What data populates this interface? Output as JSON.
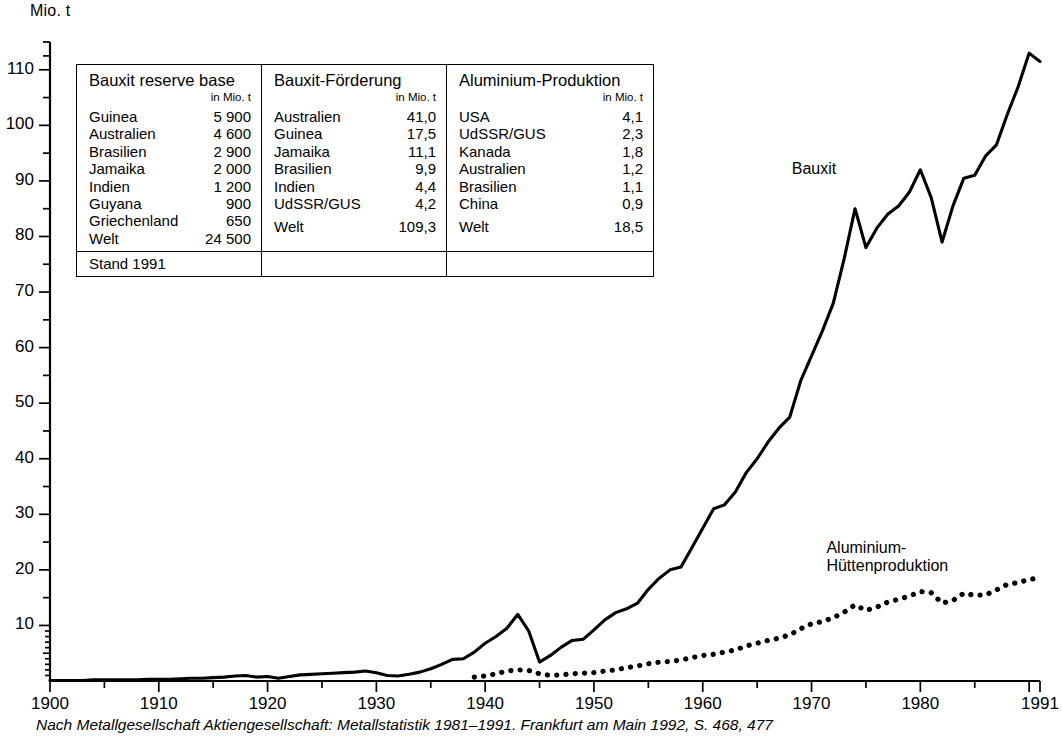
{
  "axis": {
    "y_unit": "Mio. t",
    "y_ticks": [
      "10",
      "20",
      "30",
      "40",
      "50",
      "60",
      "70",
      "80",
      "90",
      "100",
      "110"
    ],
    "x_ticks": [
      "1900",
      "1910",
      "1920",
      "1930",
      "1940",
      "1950",
      "1960",
      "1970",
      "1980",
      "1991"
    ]
  },
  "series_labels": {
    "bauxit": "Bauxit",
    "aluminium": "Aluminium-\nHüttenproduktion"
  },
  "caption": "Nach Metallgesellschaft Aktiengesellschaft: Metallstatistik 1981–1991. Frankfurt am Main 1992, S. 468, 477",
  "table": {
    "columns": [
      {
        "header": "Bauxit reserve base",
        "unit": "in Mio. t",
        "rows": [
          {
            "label": "Guinea",
            "value": "5 900"
          },
          {
            "label": "Australien",
            "value": "4 600"
          },
          {
            "label": "Brasilien",
            "value": "2 900"
          },
          {
            "label": "Jamaika",
            "value": "2 000"
          },
          {
            "label": "Indien",
            "value": "1 200"
          },
          {
            "label": "Guyana",
            "value": "900"
          },
          {
            "label": "Griechenland",
            "value": "650"
          }
        ],
        "total": {
          "label": "Welt",
          "value": "24 500"
        },
        "footer": "Stand 1991"
      },
      {
        "header": "Bauxit-Förderung",
        "unit": "in Mio. t",
        "rows": [
          {
            "label": "Australien",
            "value": "41,0"
          },
          {
            "label": "Guinea",
            "value": "17,5"
          },
          {
            "label": "Jamaika",
            "value": "11,1"
          },
          {
            "label": "Brasilien",
            "value": "9,9"
          },
          {
            "label": "Indien",
            "value": "4,4"
          },
          {
            "label": "UdSSR/GUS",
            "value": "4,2"
          }
        ],
        "total": {
          "label": "Welt",
          "value": "109,3"
        },
        "footer": ""
      },
      {
        "header": "Aluminium-Produktion",
        "unit": "in Mio. t",
        "rows": [
          {
            "label": "USA",
            "value": "4,1"
          },
          {
            "label": "UdSSR/GUS",
            "value": "2,3"
          },
          {
            "label": "Kanada",
            "value": "1,8"
          },
          {
            "label": "Australien",
            "value": "1,2"
          },
          {
            "label": "Brasilien",
            "value": "1,1"
          },
          {
            "label": "China",
            "value": "0,9"
          }
        ],
        "total": {
          "label": "Welt",
          "value": "18,5"
        },
        "footer": ""
      }
    ]
  },
  "chart_data": {
    "type": "line",
    "title": "",
    "xlabel": "",
    "ylabel": "Mio. t",
    "xlim": [
      1900,
      1991
    ],
    "ylim": [
      0,
      115
    ],
    "grid": false,
    "legend": "inline-annotations",
    "series": [
      {
        "name": "Bauxit",
        "style": "solid",
        "color": "#000000",
        "x": [
          1900,
          1901,
          1902,
          1903,
          1904,
          1905,
          1906,
          1907,
          1908,
          1909,
          1910,
          1911,
          1912,
          1913,
          1914,
          1915,
          1916,
          1917,
          1918,
          1919,
          1920,
          1921,
          1922,
          1923,
          1924,
          1925,
          1926,
          1927,
          1928,
          1929,
          1930,
          1931,
          1932,
          1933,
          1934,
          1935,
          1936,
          1937,
          1938,
          1939,
          1940,
          1941,
          1942,
          1943,
          1944,
          1945,
          1946,
          1947,
          1948,
          1949,
          1950,
          1951,
          1952,
          1953,
          1954,
          1955,
          1956,
          1957,
          1958,
          1959,
          1960,
          1961,
          1962,
          1963,
          1964,
          1965,
          1966,
          1967,
          1968,
          1969,
          1970,
          1971,
          1972,
          1973,
          1974,
          1975,
          1976,
          1977,
          1978,
          1979,
          1980,
          1981,
          1982,
          1983,
          1984,
          1985,
          1986,
          1987,
          1988,
          1989,
          1990,
          1991
        ],
        "y": [
          0.1,
          0.1,
          0.1,
          0.1,
          0.2,
          0.2,
          0.2,
          0.2,
          0.2,
          0.3,
          0.3,
          0.3,
          0.4,
          0.5,
          0.5,
          0.6,
          0.7,
          0.9,
          1.0,
          0.7,
          0.8,
          0.5,
          0.8,
          1.1,
          1.2,
          1.3,
          1.4,
          1.5,
          1.6,
          1.8,
          1.5,
          1.0,
          0.9,
          1.2,
          1.6,
          2.2,
          3.0,
          3.9,
          4.0,
          5.2,
          6.8,
          8.0,
          9.5,
          12.0,
          9.0,
          3.4,
          4.6,
          6.1,
          7.3,
          7.5,
          9.2,
          11.0,
          12.3,
          13.0,
          14.0,
          16.5,
          18.5,
          20.0,
          20.5,
          24.0,
          27.5,
          31.0,
          31.7,
          34.0,
          37.5,
          40.0,
          43.0,
          45.5,
          47.5,
          54.0,
          58.5,
          63.0,
          68.0,
          76.0,
          85.0,
          78.0,
          81.5,
          84.0,
          85.5,
          88.0,
          92.0,
          87.0,
          79.0,
          85.5,
          90.5,
          91.0,
          94.5,
          96.5,
          102.0,
          107.0,
          113.0,
          111.5
        ]
      },
      {
        "name": "Aluminium-Hüttenproduktion",
        "style": "dotted",
        "color": "#000000",
        "x": [
          1939,
          1940,
          1941,
          1942,
          1943,
          1944,
          1945,
          1946,
          1947,
          1948,
          1949,
          1950,
          1951,
          1952,
          1953,
          1954,
          1955,
          1956,
          1957,
          1958,
          1959,
          1960,
          1961,
          1962,
          1963,
          1964,
          1965,
          1966,
          1967,
          1968,
          1969,
          1970,
          1971,
          1972,
          1973,
          1974,
          1975,
          1976,
          1977,
          1978,
          1979,
          1980,
          1981,
          1982,
          1983,
          1984,
          1985,
          1986,
          1987,
          1988,
          1989,
          1990,
          1991
        ],
        "y": [
          0.7,
          0.9,
          1.3,
          1.8,
          2.0,
          1.9,
          1.3,
          1.0,
          1.1,
          1.3,
          1.4,
          1.5,
          1.8,
          2.0,
          2.4,
          2.7,
          3.1,
          3.4,
          3.5,
          3.8,
          4.2,
          4.6,
          4.8,
          5.2,
          5.6,
          6.3,
          6.8,
          7.3,
          7.7,
          8.3,
          9.4,
          10.3,
          10.7,
          11.4,
          12.4,
          13.7,
          12.7,
          13.3,
          14.2,
          14.7,
          15.3,
          16.1,
          15.9,
          14.0,
          14.5,
          15.8,
          15.4,
          15.5,
          16.4,
          17.4,
          17.7,
          18.3,
          18.5
        ]
      }
    ]
  }
}
